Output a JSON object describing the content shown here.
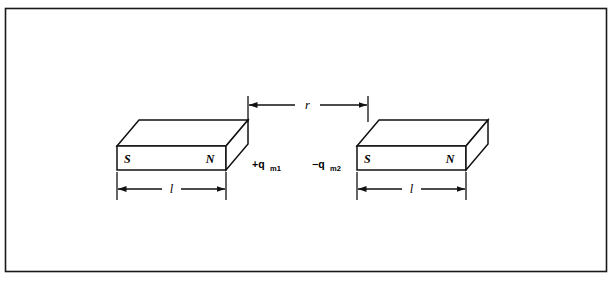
{
  "figure": {
    "type": "physics-diagram",
    "border_color": "#1a1a1a",
    "line_color": "#111111",
    "background_color": "#ffffff"
  },
  "magnets": [
    {
      "id": "left-magnet",
      "south_pole_label": "S",
      "north_pole_label": "N",
      "charge_symbol": "+q",
      "charge_subscript": "m1",
      "length_label": "l"
    },
    {
      "id": "right-magnet",
      "south_pole_label": "S",
      "north_pole_label": "N",
      "charge_symbol": "−q",
      "charge_subscript": "m2",
      "length_label": "l"
    }
  ],
  "separation": {
    "label": "r",
    "description": "distance between adjacent poles"
  }
}
